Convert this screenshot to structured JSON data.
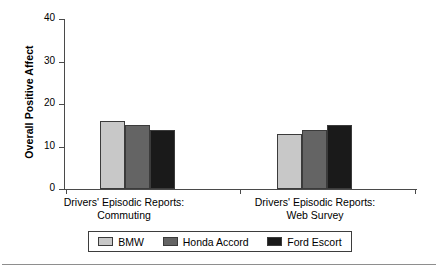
{
  "chart_data": {
    "type": "bar",
    "title": "",
    "xlabel": "",
    "ylabel": "Overall Positive Affect",
    "ylim": [
      0,
      40
    ],
    "yticks": [
      0,
      10,
      20,
      30,
      40
    ],
    "grid": false,
    "legend_position": "bottom",
    "categories": [
      "Drivers' Episodic Reports: Commuting",
      "Drivers' Episodic Reports: Web Survey"
    ],
    "category_lines": [
      [
        "Drivers' Episodic Reports:",
        "Commuting"
      ],
      [
        "Drivers' Episodic Reports:",
        "Web Survey"
      ]
    ],
    "series": [
      {
        "name": "BMW",
        "color": "#c8c8c8",
        "values": [
          16,
          13
        ]
      },
      {
        "name": "Honda Accord",
        "color": "#646464",
        "values": [
          15,
          14
        ]
      },
      {
        "name": "Ford Escort",
        "color": "#1a1a1a",
        "values": [
          14,
          15
        ]
      }
    ]
  },
  "axis": {
    "tick_0": "0",
    "tick_10": "10",
    "tick_20": "20",
    "tick_30": "30",
    "tick_40": "40"
  },
  "legend": {
    "items": [
      {
        "label": "BMW"
      },
      {
        "label": "Honda Accord"
      },
      {
        "label": "Ford Escort"
      }
    ]
  },
  "groups": [
    {
      "line1": "Drivers' Episodic Reports:",
      "line2": "Commuting"
    },
    {
      "line1": "Drivers' Episodic Reports:",
      "line2": "Web Survey"
    }
  ]
}
